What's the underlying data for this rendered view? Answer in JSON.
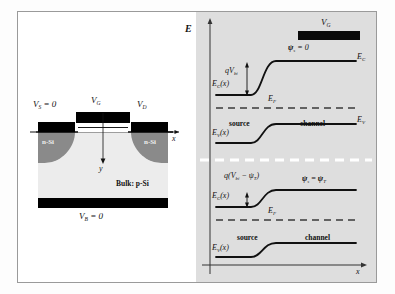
{
  "figure": {
    "type": "two-panel-semiconductor-figure",
    "background": "#ffffff",
    "frame_color": "#9a9a9a",
    "panel_right_bg": "#dedede"
  },
  "left_panel": {
    "name": "mosfet-cross-section",
    "labels": {
      "source_contact": "V",
      "source_contact_sub": "S",
      "source_contact_eq": " = 0",
      "gate_contact": "V",
      "gate_contact_sub": "G",
      "drain_contact": "V",
      "drain_contact_sub": "D",
      "body_contact": "V",
      "body_contact_sub": "B",
      "body_contact_eq": " = 0",
      "source_region": "n-Si",
      "drain_region": "n-Si",
      "bulk": "Bulk: p-Si",
      "axis_x": "x",
      "axis_y": "y"
    },
    "colors": {
      "metal": "#000000",
      "nsi": "#8a8a8a",
      "psi": "#ececec",
      "oxide": "#ffffff"
    }
  },
  "right_panel": {
    "name": "energy-band-diagram",
    "axis": {
      "y_label": "E",
      "x_label": "x"
    },
    "upper_diagram": {
      "gate_label": "V",
      "gate_label_sub": "G",
      "surface_potential": "ψ",
      "surface_potential_sub": "s",
      "surface_potential_eq": " = 0",
      "ec_of_x": "E",
      "ec_of_x_sub": "C",
      "ec_of_x_tail": "(x)",
      "ev_of_x": "E",
      "ev_of_x_sub": "V",
      "ev_of_x_tail": "(x)",
      "barrier": "qV",
      "barrier_sub": "bi",
      "fermi": "E",
      "fermi_sub": "F",
      "ec_right": "E",
      "ec_right_sub": "C",
      "ev_right": "E",
      "ev_right_sub": "V",
      "region_left": "source",
      "region_right": "channel"
    },
    "lower_diagram": {
      "surface_potential": "ψ",
      "surface_potential_sub": "s",
      "surface_potential_eq": " = ψ",
      "surface_potential_eq_sub": "T",
      "barrier_pre": "q(V",
      "barrier_sub1": "bi",
      "barrier_mid": " − ψ",
      "barrier_sub2": "T",
      "barrier_post": ")",
      "ec_of_x": "E",
      "ec_of_x_sub": "C",
      "ec_of_x_tail": "(x)",
      "ev_of_x": "E",
      "ev_of_x_sub": "V",
      "ev_of_x_tail": "(x)",
      "fermi": "E",
      "fermi_sub": "F",
      "region_left": "source",
      "region_right": "channel"
    },
    "divider": "white-dashed-separator"
  }
}
